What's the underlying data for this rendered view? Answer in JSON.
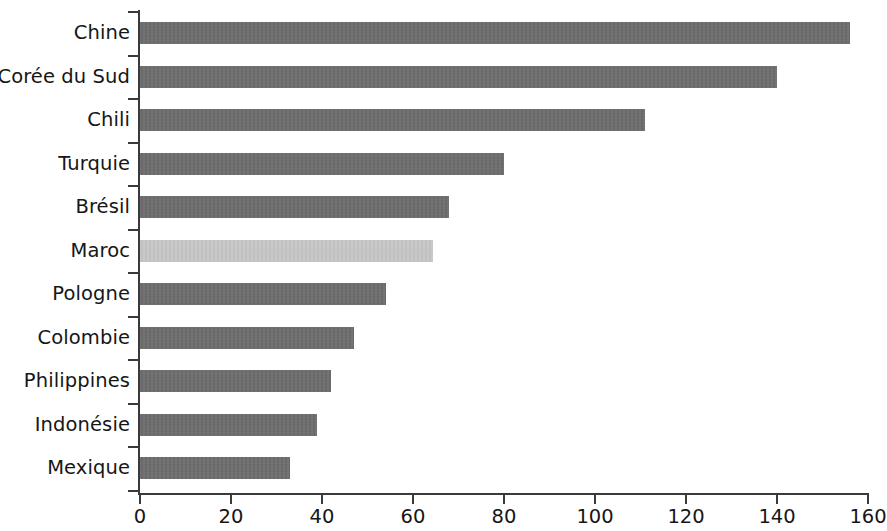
{
  "chart_data": {
    "type": "bar",
    "orientation": "horizontal",
    "title": "",
    "subtitle": "",
    "xlabel": "",
    "ylabel": "",
    "categories": [
      "Chine",
      "Corée du Sud",
      "Chili",
      "Turquie",
      "Brésil",
      "Maroc",
      "Pologne",
      "Colombie",
      "Philippines",
      "Indonésie",
      "Mexique"
    ],
    "values": [
      156,
      140,
      111,
      80,
      68,
      64.5,
      54,
      47,
      42,
      39,
      33
    ],
    "series": [
      {
        "name": "",
        "values": [
          156,
          140,
          111,
          80,
          68,
          64.5,
          54,
          47,
          42,
          39,
          33
        ]
      }
    ],
    "highlighted_category": "Maroc",
    "xlim": [
      0,
      160
    ],
    "xticks": [
      0,
      20,
      40,
      60,
      80,
      100,
      120,
      140,
      160
    ],
    "xtick_labels": [
      "0",
      "20",
      "40",
      "60",
      "80",
      "100",
      "120",
      "140",
      "160"
    ],
    "grid": false,
    "legend": null,
    "annotations": [],
    "colors": {
      "bar": "#6e6e6e",
      "bar_highlight": "#c9c9c9",
      "axis": "#3a3a3a",
      "text": "#161616",
      "background": "#ffffff"
    }
  }
}
